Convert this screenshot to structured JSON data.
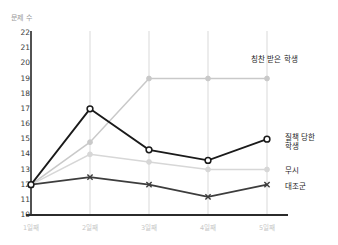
{
  "chart_data": {
    "type": "line",
    "title": "",
    "ylabel": "문제 수",
    "xlabel": "",
    "categories": [
      "1일째",
      "2일째",
      "3일째",
      "4일째",
      "5일째"
    ],
    "ylim": [
      10,
      22
    ],
    "yticks": [
      10,
      11,
      12,
      13,
      14,
      15,
      16,
      17,
      18,
      19,
      20,
      21,
      22
    ],
    "grid": "vertical",
    "legend_position": "inline-right",
    "series": [
      {
        "name": "칭찬 받은 학생",
        "values": [
          12,
          14.8,
          19,
          19,
          19
        ],
        "color": "#c9c9c9",
        "marker": "circle"
      },
      {
        "name": "질책 당한 학생",
        "values": [
          12,
          17,
          14.3,
          13.6,
          15
        ],
        "color": "#1a1a1a",
        "marker": "circle-open"
      },
      {
        "name": "무시",
        "values": [
          12,
          14,
          13.5,
          13,
          13
        ],
        "color": "#d7d7d7",
        "marker": "circle"
      },
      {
        "name": "대조군",
        "values": [
          12,
          12.5,
          12,
          11.2,
          12
        ],
        "color": "#3d3d3d",
        "marker": "x"
      }
    ]
  },
  "labels": {
    "praised": "칭찬 받은 학생",
    "scolded_line1": "질책 당한",
    "scolded_line2": "학생",
    "ignored": "무시",
    "control": "대조군"
  },
  "colors": {
    "axis": "#2b2b2b",
    "gridline": "#d9d9d9",
    "ytick_text": "#3a3a3a",
    "xtick_text": "#c6c6c6",
    "axis_title_text": "#9a9a9a"
  }
}
